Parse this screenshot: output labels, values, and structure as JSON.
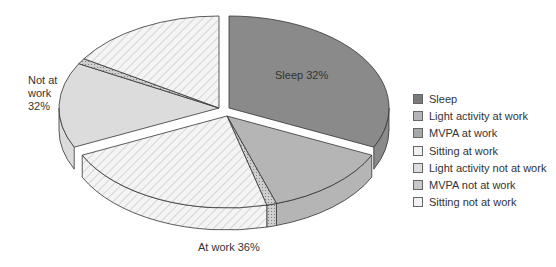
{
  "chart_data": {
    "type": "pie",
    "style": "3d-exploded",
    "title": "",
    "groups": [
      {
        "label": "Sleep 32%",
        "name": "Sleep",
        "value": 32
      },
      {
        "label": "At work 36%",
        "name": "At work",
        "value": 36
      },
      {
        "label": "Not at work 32%",
        "name": "Not at work",
        "value": 32
      }
    ],
    "slices": [
      {
        "name": "Sleep",
        "group": "Sleep",
        "value": 32,
        "color": "#8a8a8a",
        "pattern": "solid"
      },
      {
        "name": "Light activity at work",
        "group": "At work",
        "value": 13,
        "color": "#b5b5b5",
        "pattern": "solid"
      },
      {
        "name": "MVPA at work",
        "group": "At work",
        "value": 1,
        "color": "#a8a8a8",
        "pattern": "dots"
      },
      {
        "name": "Sitting at work",
        "group": "At work",
        "value": 22,
        "color": "#eeeeee",
        "pattern": "hatch"
      },
      {
        "name": "Light activity not at work",
        "group": "Not at work",
        "value": 15,
        "color": "#dcdcdc",
        "pattern": "solid"
      },
      {
        "name": "MVPA not at work",
        "group": "Not at work",
        "value": 1,
        "color": "#c8c8c8",
        "pattern": "dots"
      },
      {
        "name": "Sitting not at work",
        "group": "Not at work",
        "value": 16,
        "color": "#f2f2f2",
        "pattern": "hatch"
      }
    ],
    "legend_position": "right"
  },
  "labels": {
    "sleep": "Sleep 32%",
    "not_at_work_1": "Not at",
    "not_at_work_2": "work",
    "not_at_work_3": "32%",
    "at_work": "At work 36%"
  },
  "legend": [
    {
      "label": "Sleep"
    },
    {
      "label": "Light activity at work"
    },
    {
      "label": "MVPA at work"
    },
    {
      "label": "Sitting at work"
    },
    {
      "label": "Light activity not at work"
    },
    {
      "label": "MVPA not at work"
    },
    {
      "label": "Sitting not at work"
    }
  ]
}
